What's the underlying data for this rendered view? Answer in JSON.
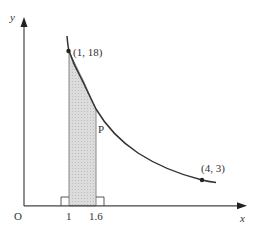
{
  "diagram": {
    "type": "graph-of-curve-with-shaded-region",
    "curve": "y = 18/x",
    "origin_label": "O",
    "x_axis_label": "x",
    "y_axis_label": "y",
    "x_tick_labels": [
      "1",
      "1.6"
    ],
    "points": [
      {
        "label": "(1, 18)",
        "x": 1,
        "y": 18
      },
      {
        "label": "(4, 3)",
        "x": 4,
        "y": 3
      },
      {
        "label": "P",
        "x": 1.6,
        "y": 11.25
      }
    ],
    "shaded_region": {
      "x_from": 1,
      "x_to": 1.6,
      "description": "area under curve between x = 1 and x = 1.6"
    },
    "colors": {
      "axis": "#333333",
      "curve": "#333333",
      "shade": "#d9d9d9",
      "text": "#333333"
    }
  },
  "labels": {
    "origin": "O",
    "x_axis": "x",
    "y_axis": "y",
    "tick_1": "1",
    "tick_1_6": "1.6",
    "point_a": "(1, 18)",
    "point_b": "(4, 3)",
    "point_p": "P"
  }
}
